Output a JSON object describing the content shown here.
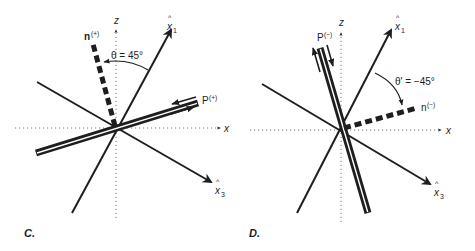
{
  "panels": [
    {
      "id": "C",
      "caption": "C.",
      "axes": {
        "x_label": "x",
        "z_label": "z",
        "x1_label": "x",
        "x1_hat": "^",
        "x1_sub": "1",
        "x3_label": "x",
        "x3_hat": "^",
        "x3_sub": "3"
      },
      "normal": {
        "label": "n",
        "superscript": "(+)"
      },
      "plane": {
        "label": "P",
        "superscript": "(+)"
      },
      "angle": {
        "label": "θ = 45°"
      }
    },
    {
      "id": "D",
      "caption": "D.",
      "axes": {
        "x_label": "x",
        "z_label": "z",
        "x1_label": "x",
        "x1_hat": "^",
        "x1_sub": "1",
        "x3_label": "x",
        "x3_hat": "^",
        "x3_sub": "3"
      },
      "normal": {
        "label": "n",
        "superscript": "(−)"
      },
      "plane": {
        "label": "P",
        "superscript": "(−)"
      },
      "angle": {
        "label": "θ' = −45°"
      }
    }
  ],
  "colors": {
    "ink": "#1e1e1e",
    "dotted_axis": "#777777",
    "background": "#ffffff"
  }
}
